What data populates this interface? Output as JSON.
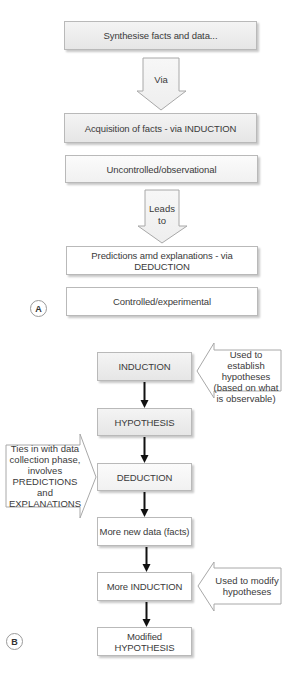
{
  "panel_a": {
    "label": "A",
    "boxes": [
      {
        "text": "Synthesise facts and data..."
      },
      {
        "text": "Acquisition of facts - via INDUCTION"
      },
      {
        "text": "Uncontrolled/observational"
      },
      {
        "text": "Predictions amd explanations - via DEDUCTION"
      },
      {
        "text": "Controlled/experimental"
      }
    ],
    "arrows": [
      {
        "label_line1": "Via",
        "label_line2": ""
      },
      {
        "label_line1": "Leads",
        "label_line2": "to"
      }
    ]
  },
  "panel_b": {
    "label": "B",
    "steps": [
      {
        "text": "INDUCTION"
      },
      {
        "text": "HYPOTHESIS"
      },
      {
        "text": "DEDUCTION"
      },
      {
        "text": "More new data (facts)"
      },
      {
        "text": "More INDUCTION"
      },
      {
        "text": "Modified HYPOTHESIS"
      }
    ],
    "callouts": {
      "establish": {
        "lines": [
          "Used to establish",
          "hypotheses",
          "(based on what",
          "is observable)"
        ]
      },
      "ties_in": {
        "lines": [
          "Ties in with data",
          "collection phase,",
          "involves",
          "PREDICTIONS",
          "and",
          "EXPLANATIONS"
        ]
      },
      "modify": {
        "lines": [
          "Used to modify",
          "hypotheses"
        ]
      }
    }
  },
  "colors": {
    "box_border": "#b9b9b9",
    "box_gray_top": "#f4f4f4",
    "box_gray_bottom": "#e6e6e6",
    "text": "#3a3a3a",
    "connector": "#111111",
    "hollow_arrow_stroke": "#a8a8a8"
  }
}
